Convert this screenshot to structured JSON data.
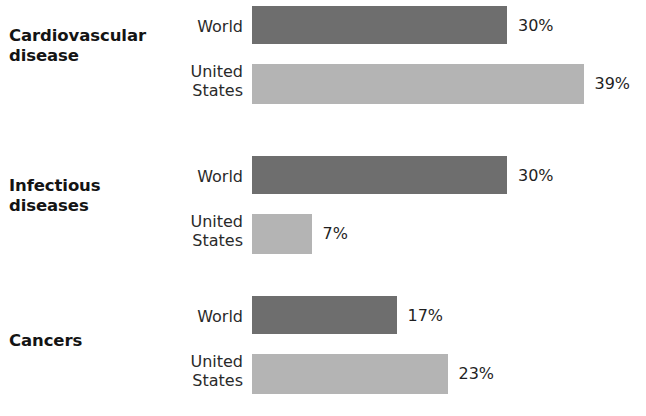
{
  "chart_data": {
    "type": "bar",
    "orientation": "horizontal",
    "title": "",
    "subtitle": "",
    "xlabel": "",
    "ylabel": "",
    "grid": false,
    "legend_position": "none",
    "value_suffix": "%",
    "xlim": [
      0,
      40
    ],
    "categories": [
      "Cardiovascular disease",
      "Infectious diseases",
      "Cancers"
    ],
    "series": [
      {
        "name": "World",
        "values": [
          30,
          30,
          17
        ],
        "color": "#6e6e6e"
      },
      {
        "name": "United States",
        "values": [
          39,
          7,
          23
        ],
        "color": "#b4b4b4"
      }
    ],
    "groups": [
      {
        "category_label": "Cardiovascular\ndisease",
        "bars": [
          {
            "series": "World",
            "label": "World",
            "value": 30,
            "value_label": "30%",
            "color": "#6e6e6e"
          },
          {
            "series": "United States",
            "label": "United\nStates",
            "value": 39,
            "value_label": "39%",
            "color": "#b4b4b4"
          }
        ]
      },
      {
        "category_label": "Infectious\ndiseases",
        "bars": [
          {
            "series": "World",
            "label": "World",
            "value": 30,
            "value_label": "30%",
            "color": "#6e6e6e"
          },
          {
            "series": "United States",
            "label": "United\nStates",
            "value": 7,
            "value_label": "7%",
            "color": "#b4b4b4"
          }
        ]
      },
      {
        "category_label": "Cancers",
        "bars": [
          {
            "series": "World",
            "label": "World",
            "value": 17,
            "value_label": "17%",
            "color": "#6e6e6e"
          },
          {
            "series": "United States",
            "label": "United\nStates",
            "value": 23,
            "value_label": "23%",
            "color": "#b4b4b4"
          }
        ]
      }
    ]
  },
  "style": {
    "background": "#ffffff",
    "world_color": "#6e6e6e",
    "us_color": "#b4b4b4",
    "text_color": "#1a1a1a"
  }
}
